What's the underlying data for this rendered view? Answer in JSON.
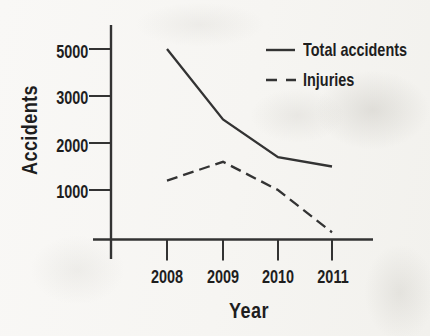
{
  "chart_data": {
    "type": "line",
    "title": "",
    "xlabel": "Year",
    "ylabel": "Accidents",
    "categories": [
      "2008",
      "2009",
      "2010",
      "2011"
    ],
    "series": [
      {
        "name": "Total accidents",
        "line_style": "solid",
        "values": [
          5000,
          2500,
          1700,
          1500
        ]
      },
      {
        "name": "Injuries",
        "line_style": "dashed",
        "values": [
          1200,
          1600,
          1000,
          100
        ]
      }
    ],
    "y_ticks": {
      "values": [
        1000,
        2000,
        3000,
        5000
      ],
      "labels": [
        "1000",
        "2000",
        "3000",
        "5000"
      ]
    },
    "ylim": [
      0,
      5500
    ],
    "grid": false,
    "legend_position": "top-right",
    "colors": {
      "line": "#333333",
      "text": "#1e1e1e",
      "paper": "#f7f6f3"
    },
    "layout": {
      "x_tick_px": [
        167,
        223,
        278,
        332
      ],
      "y_tick_px": [
        190,
        143,
        96,
        49
      ],
      "axis": {
        "y_line_x": 111,
        "y_line_y1": 25,
        "y_line_y2": 259,
        "x_line_y": 239.5,
        "x_line_x1": 93,
        "x_line_x2": 373,
        "tick_len": 21
      }
    }
  }
}
